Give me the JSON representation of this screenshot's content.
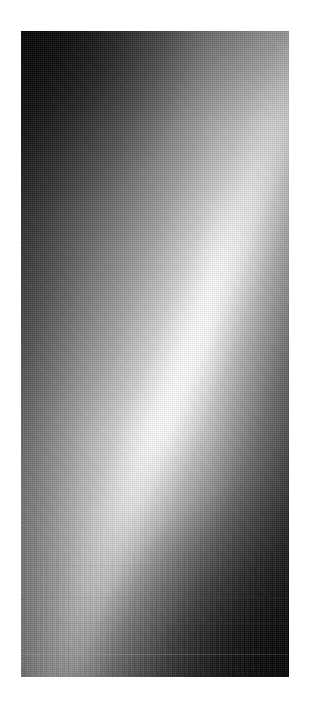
{
  "page": {
    "background_color": "#ffffff",
    "width": 309,
    "height": 710
  },
  "plate": {
    "name": "grayscale-diagonal-band-image",
    "left": 21,
    "top": 31,
    "width": 268,
    "height": 646,
    "description": "Monochrome dithered intensity field with a bright diagonal ridge running from the lower-left edge up to the upper-right edge, with dark corners at top-left and bottom-right."
  },
  "chart_data": {
    "type": "heatmap",
    "title": "",
    "subtitle": "",
    "xlabel": "",
    "ylabel": "",
    "colormap": "grayscale",
    "grid": false,
    "legend": "none",
    "xlim": [
      0,
      268
    ],
    "ylim": [
      0,
      646
    ],
    "tick_labels": {
      "x": [],
      "y": []
    },
    "annotations": [],
    "features": [
      {
        "name": "bright-diagonal-ridge",
        "kind": "line",
        "x": [
          0,
          67,
          134,
          201,
          268
        ],
        "y": [
          455,
          392,
          329,
          266,
          203
        ],
        "slope": -0.94,
        "peak_intensity": 255,
        "ridge_half_width_px": 6
      },
      {
        "name": "dark-corner-top-left",
        "kind": "region",
        "center": [
          0,
          0
        ],
        "intensity": 12
      },
      {
        "name": "dark-corner-bottom-right",
        "kind": "region",
        "center": [
          268,
          646
        ],
        "intensity": 14
      },
      {
        "name": "mid-gray-corner-top-right",
        "kind": "region",
        "center": [
          268,
          0
        ],
        "intensity": 130
      },
      {
        "name": "mid-gray-corner-bottom-left",
        "kind": "region",
        "center": [
          0,
          646
        ],
        "intensity": 140
      }
    ],
    "scanlines": [
      {
        "name": "scanline-upper",
        "y": 534,
        "intensity": 100,
        "opacity": 0.12
      },
      {
        "name": "scanline-mid",
        "y": 566,
        "intensity": 120,
        "opacity": 0.16
      },
      {
        "name": "scanline-lower",
        "y": 592,
        "intensity": 110,
        "opacity": 0.14
      },
      {
        "name": "scanline-bright",
        "y": 623,
        "intensity": 180,
        "opacity": 0.3
      },
      {
        "name": "scanline-bottom",
        "y": 637,
        "intensity": 95,
        "opacity": 0.1
      }
    ],
    "intensity_profile_left_edge": {
      "y": [
        0,
        80,
        160,
        240,
        320,
        400,
        455,
        520,
        580,
        646
      ],
      "value": [
        10,
        40,
        78,
        118,
        165,
        218,
        252,
        205,
        160,
        142
      ]
    },
    "intensity_profile_right_edge": {
      "y": [
        0,
        80,
        160,
        203,
        280,
        360,
        440,
        520,
        580,
        646
      ],
      "value": [
        128,
        158,
        208,
        250,
        196,
        140,
        92,
        52,
        30,
        14
      ]
    },
    "intensity_profile_center_column": {
      "y": [
        0,
        80,
        160,
        240,
        329,
        420,
        500,
        580,
        646
      ],
      "value": [
        42,
        72,
        112,
        160,
        248,
        178,
        118,
        76,
        52
      ]
    }
  }
}
